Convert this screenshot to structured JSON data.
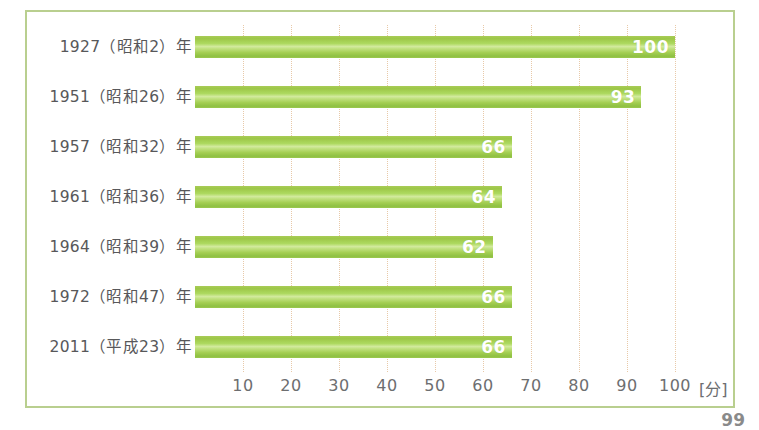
{
  "chart_data": {
    "type": "bar",
    "orientation": "horizontal",
    "title": "",
    "xlabel": "[分]",
    "ylabel": "",
    "xlim": [
      0,
      100
    ],
    "grid": true,
    "legend": null,
    "unit_label": "[分]",
    "categories": [
      "1927（昭和2）年",
      "1951（昭和26）年",
      "1957（昭和32）年",
      "1961（昭和36）年",
      "1964（昭和39）年",
      "1972（昭和47）年",
      "2011（平成23）年"
    ],
    "values": [
      100,
      93,
      66,
      64,
      62,
      66,
      66
    ],
    "value_labels": [
      "100",
      "93",
      "66",
      "64",
      "62",
      "66",
      "66"
    ],
    "xticks": [
      10,
      20,
      30,
      40,
      50,
      60,
      70,
      80,
      90,
      100
    ],
    "xtick_labels": [
      "10",
      "20",
      "30",
      "40",
      "50",
      "60",
      "70",
      "80",
      "90",
      "100"
    ],
    "colors": {
      "bar_dark": "#9dc748",
      "bar_mid": "#add95f",
      "bar_highlight": "#d2ea9e",
      "bar_base": "#8fc043",
      "gridline": "#e8c9a8",
      "frame_border": "#b9cf8f",
      "label_text": "#58585a",
      "tick_text": "#6d6e70",
      "value_text": "#ffffff",
      "background": "#ffffff"
    }
  },
  "page": {
    "page_number": "99"
  }
}
